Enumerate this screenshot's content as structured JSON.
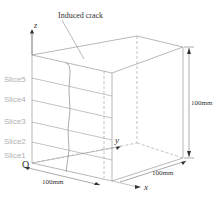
{
  "figure": {
    "annotation": "Induced crack",
    "origin_label": "O",
    "axes": {
      "x": "x",
      "y": "y",
      "z": "z"
    },
    "dimensions": {
      "width": "100mm",
      "depth": "100mm",
      "height": "100mm"
    },
    "slices": [
      "Slice5",
      "Slice4",
      "Slice3",
      "Slice2",
      "Slice1"
    ],
    "colors": {
      "edges": "#9a9a9a",
      "slice_labels": "#b0b0b0",
      "text": "#333333"
    }
  }
}
